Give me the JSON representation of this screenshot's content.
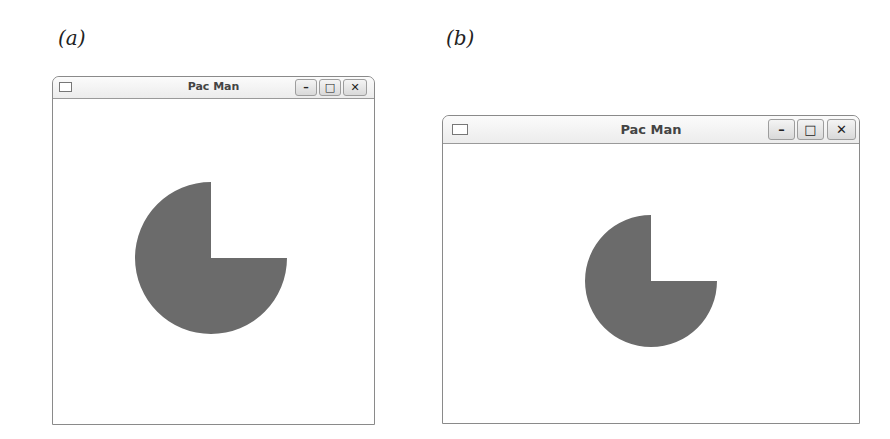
{
  "panels": [
    {
      "label": "(a)",
      "window": {
        "title": "Pac Man",
        "buttons": {
          "minimize": "–",
          "maximize": "□",
          "close": "✕"
        },
        "icons": {
          "window_menu": "window-menu-icon"
        }
      },
      "pacman": {
        "fill": "#6b6b6b",
        "mouth": "upper-right quadrant open"
      }
    },
    {
      "label": "(b)",
      "window": {
        "title": "Pac Man",
        "buttons": {
          "minimize": "–",
          "maximize": "□",
          "close": "✕"
        },
        "icons": {
          "window_menu": "window-menu-icon"
        }
      },
      "pacman": {
        "fill": "#6b6b6b",
        "mouth": "upper-right quadrant open"
      }
    }
  ]
}
